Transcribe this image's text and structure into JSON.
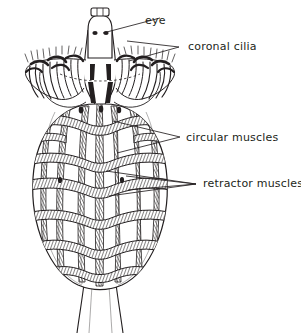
{
  "figure": {
    "background_color": "#ffffff",
    "ink_color": "#231f20",
    "width": 301,
    "height": 333
  },
  "labels": [
    {
      "id": "eye",
      "text": "eye",
      "x": 145,
      "y": 24,
      "leader_points": "103,33 160,18",
      "fork": false
    },
    {
      "id": "coronal-cilia",
      "text": "coronal cilia",
      "x": 188,
      "y": 50,
      "leader_points": "130,60 178,47 128,42",
      "fork": true
    },
    {
      "id": "circular-muscles",
      "text": "circular muscles",
      "x": 186,
      "y": 141,
      "leader_points": "113,121 180,137 118,152",
      "fork": true
    },
    {
      "id": "retractor-muscles",
      "text": "retractor muscles",
      "x": 203,
      "y": 187,
      "leader_points": "106,171 196,184 110,196",
      "fork": true
    }
  ],
  "anatomy": {
    "organs": [
      {
        "name": "eye-spot-left",
        "description": "dark pigmented eye spot"
      },
      {
        "name": "eye-spot-right",
        "description": "dark pigmented eye spot"
      },
      {
        "name": "head-cap",
        "description": "rectangular apical cap above the head"
      },
      {
        "name": "corona",
        "description": "ciliated crown, two lateral lobes"
      },
      {
        "name": "trunk",
        "description": "ovoid body with muscle lattice"
      },
      {
        "name": "foot",
        "description": "tapering posterior foot"
      }
    ],
    "circular_muscle_bands": 6,
    "retractor_muscle_strands": 7,
    "cilia_tufts_per_lobe": 5
  }
}
